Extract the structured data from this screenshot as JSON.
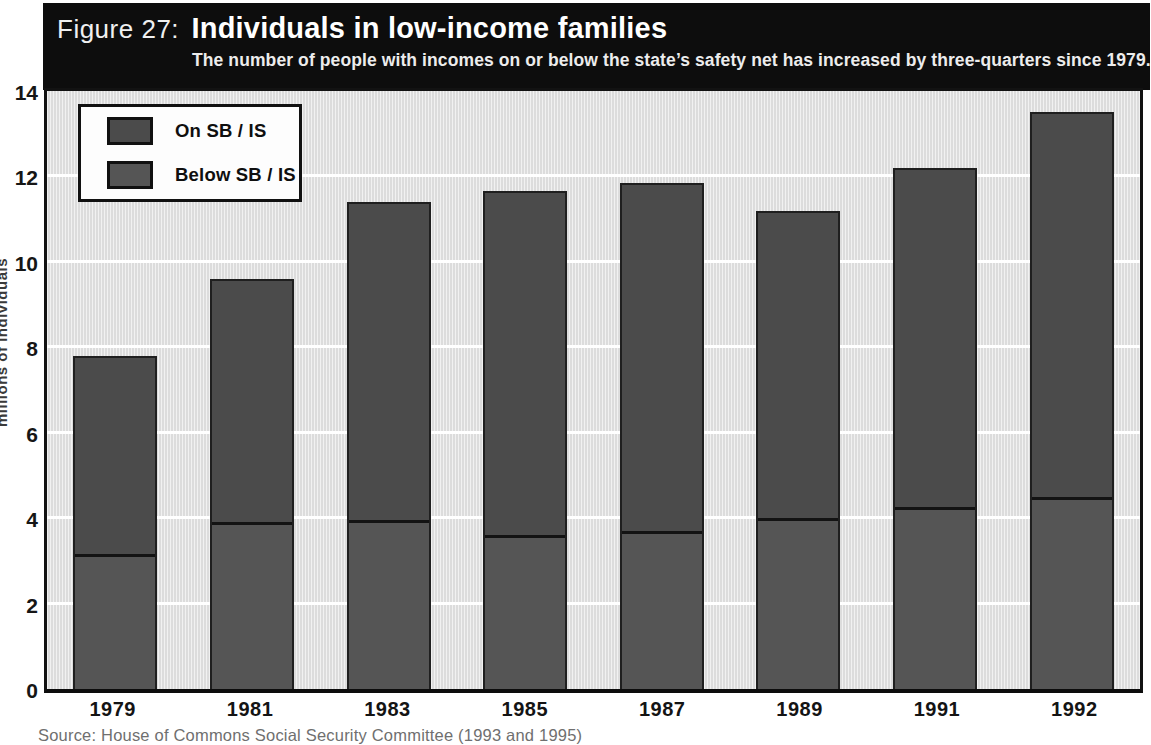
{
  "header": {
    "figure_label": "Figure 27:",
    "title": "Individuals in low-income families",
    "subtitle": "The number of people with incomes on or below the state’s safety net has increased by three-quarters since 1979."
  },
  "source": "Source: House of Commons Social Security Committee (1993 and 1995)",
  "chart_data": {
    "type": "bar",
    "stacked": true,
    "title": "Individuals in low-income families",
    "categories": [
      "1979",
      "1981",
      "1983",
      "1985",
      "1987",
      "1989",
      "1991",
      "1992"
    ],
    "series": [
      {
        "name": "Below SB / IS",
        "position": "bottom",
        "color": "#555555",
        "values": [
          3.15,
          3.9,
          3.95,
          3.6,
          3.7,
          4.0,
          4.25,
          4.5
        ]
      },
      {
        "name": "On SB / IS",
        "position": "top",
        "color": "#4b4b4b",
        "values": [
          4.65,
          5.7,
          7.45,
          8.05,
          8.15,
          7.2,
          7.95,
          9.0
        ]
      }
    ],
    "totals": [
      7.8,
      9.6,
      11.4,
      11.65,
      11.85,
      11.2,
      12.2,
      13.5
    ],
    "xlabel": "",
    "ylabel": "millions of individuals",
    "ylim": [
      0,
      14
    ],
    "yticks": [
      0,
      2,
      4,
      6,
      8,
      10,
      12,
      14
    ],
    "grid": "horizontal-white",
    "legend": {
      "position": "top-left",
      "items": [
        {
          "label": "On SB / IS",
          "color": "#4b4b4b"
        },
        {
          "label": "Below SB / IS",
          "color": "#555555"
        }
      ]
    }
  }
}
